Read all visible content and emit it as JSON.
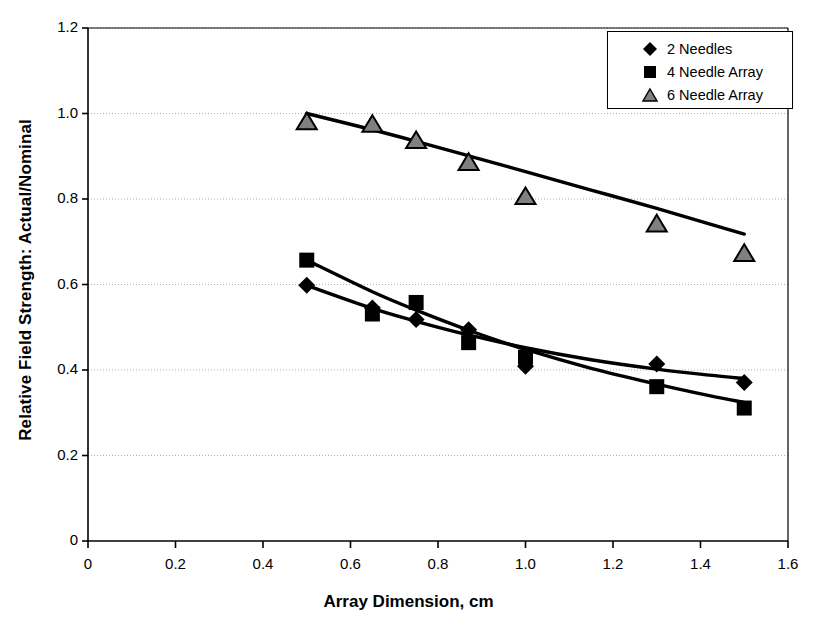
{
  "chart_data": {
    "type": "scatter",
    "title": "",
    "xlabel": "Array Dimension, cm",
    "ylabel": "Relative Field Strength: Actual/Nominal",
    "xlim": [
      0,
      1.6
    ],
    "ylim": [
      0,
      1.2
    ],
    "xticks": [
      "0",
      "0.2",
      "0.4",
      "0.6",
      "0.8",
      "1.0",
      "1.2",
      "1.4",
      "1.6"
    ],
    "yticks": [
      "0",
      "0.2",
      "0.4",
      "0.6",
      "0.8",
      "1.0",
      "1.2"
    ],
    "xtick_values": [
      0,
      0.2,
      0.4,
      0.6,
      0.8,
      1.0,
      1.2,
      1.4,
      1.6
    ],
    "ytick_values": [
      0,
      0.2,
      0.4,
      0.6,
      0.8,
      1.0,
      1.2
    ],
    "grid": "horizontal-dotted",
    "legend_position": "top-right",
    "series": [
      {
        "name": "2 Needles",
        "marker": "diamond",
        "marker_fill": "#000000",
        "x": [
          0.5,
          0.65,
          0.75,
          0.87,
          1.0,
          1.3,
          1.5
        ],
        "values": [
          0.598,
          0.545,
          0.518,
          0.494,
          0.409,
          0.414,
          0.371
        ],
        "trend": [
          [
            0.5,
            0.598
          ],
          [
            0.65,
            0.544
          ],
          [
            0.75,
            0.514
          ],
          [
            0.87,
            0.482
          ],
          [
            1.0,
            0.452
          ],
          [
            1.15,
            0.424
          ],
          [
            1.3,
            0.402
          ],
          [
            1.42,
            0.388
          ],
          [
            1.5,
            0.38
          ]
        ]
      },
      {
        "name": "4 Needle Array",
        "marker": "square",
        "marker_fill": "#000000",
        "x": [
          0.5,
          0.65,
          0.75,
          0.87,
          1.0,
          1.3,
          1.5
        ],
        "values": [
          0.657,
          0.531,
          0.558,
          0.464,
          0.43,
          0.361,
          0.311
        ],
        "trend": [
          [
            0.5,
            0.657
          ],
          [
            0.65,
            0.583
          ],
          [
            0.75,
            0.54
          ],
          [
            0.87,
            0.493
          ],
          [
            1.0,
            0.448
          ],
          [
            1.15,
            0.404
          ],
          [
            1.3,
            0.367
          ],
          [
            1.42,
            0.34
          ],
          [
            1.5,
            0.324
          ]
        ]
      },
      {
        "name": "6 Needle Array",
        "marker": "triangle",
        "marker_fill": "#808080",
        "x": [
          0.5,
          0.65,
          0.75,
          0.87,
          1.0,
          1.3,
          1.5
        ],
        "values": [
          0.981,
          0.975,
          0.937,
          0.886,
          0.806,
          0.742,
          0.673
        ],
        "trend": [
          [
            0.5,
            1.0
          ],
          [
            0.65,
            0.962
          ],
          [
            0.75,
            0.935
          ],
          [
            0.87,
            0.901
          ],
          [
            1.0,
            0.864
          ],
          [
            1.15,
            0.821
          ],
          [
            1.3,
            0.778
          ],
          [
            1.42,
            0.742
          ],
          [
            1.5,
            0.718
          ]
        ]
      }
    ]
  },
  "legend": {
    "items": [
      {
        "label": "2 Needles",
        "marker": "diamond-marker"
      },
      {
        "label": "4 Needle Array",
        "marker": "square-marker"
      },
      {
        "label": "6 Needle Array",
        "marker": "triangle-marker"
      }
    ]
  },
  "axes": {
    "x_title": "Array Dimension, cm",
    "y_title": "Relative Field Strength: Actual/Nominal"
  },
  "colors": {
    "axis": "#000000",
    "grid": "#b0b0b0",
    "series_line": "#000000",
    "triangle_fill": "#808080",
    "background": "#ffffff"
  }
}
